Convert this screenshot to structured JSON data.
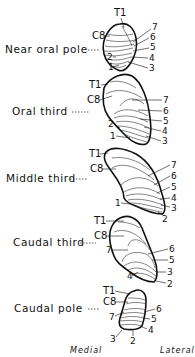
{
  "figure": {
    "type": "anatomical cross-section series",
    "orientation": {
      "left": "Medial",
      "right": "Lateral"
    },
    "sections": [
      {
        "name": "Near oral pole",
        "labels_left": [
          "T1",
          "C8",
          "2",
          "1"
        ],
        "labels_right": [
          "7",
          "6",
          "5",
          "4",
          "3"
        ]
      },
      {
        "name": "Oral third",
        "labels_left": [
          "T1",
          "C8",
          "2",
          "1"
        ],
        "labels_right": [
          "7",
          "6",
          "5",
          "4",
          "3"
        ]
      },
      {
        "name": "Middle third",
        "labels_left": [
          "T1",
          "C8",
          "1"
        ],
        "labels_right": [
          "7",
          "6",
          "5",
          "4",
          "3",
          "2"
        ]
      },
      {
        "name": "Caudal third",
        "labels_left": [
          "T1",
          "C8",
          "7",
          "4"
        ],
        "labels_right": [
          "6",
          "5",
          "3",
          "2"
        ]
      },
      {
        "name": "Caudal pole",
        "labels_left": [
          "T1",
          "C8",
          "7",
          "3"
        ],
        "labels_right": [
          "6",
          "5",
          "4",
          "2"
        ]
      }
    ]
  }
}
